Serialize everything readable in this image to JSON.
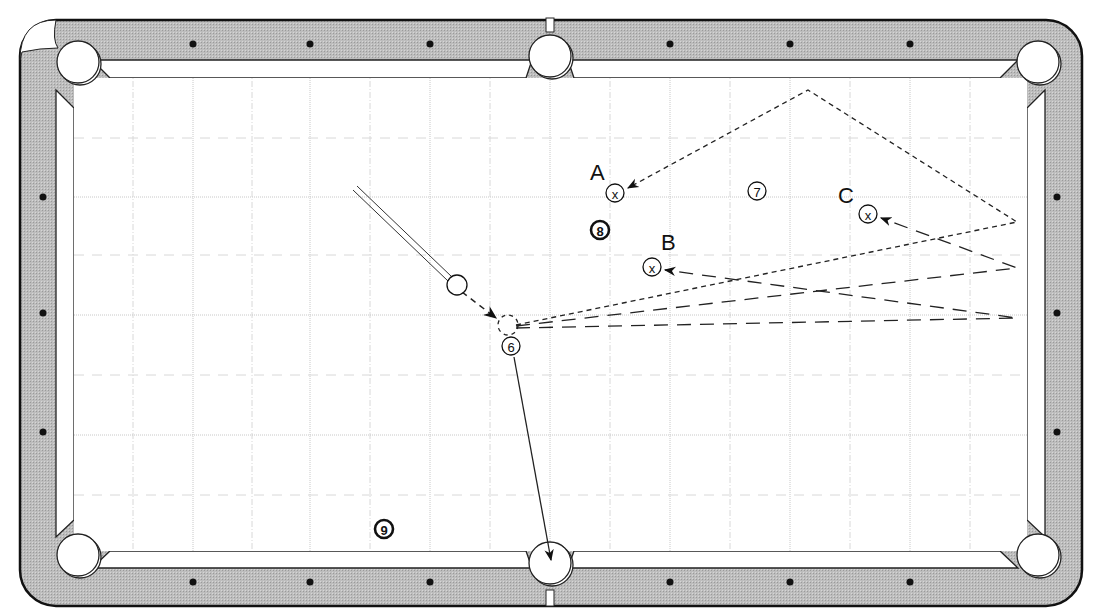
{
  "diagram": {
    "type": "pool-table-shot-diagram",
    "colors": {
      "rail": "#b8b8b8",
      "rail_outline": "#222222",
      "cloth": "#ffffff",
      "grid": "#c8c8c8",
      "ink": "#111111"
    },
    "balls": [
      {
        "id": "cue",
        "label": "",
        "x": 457,
        "y": 285
      },
      {
        "id": "6",
        "label": "6",
        "x": 511,
        "y": 346
      },
      {
        "id": "7",
        "label": "7",
        "x": 757,
        "y": 191
      },
      {
        "id": "8",
        "label": "8",
        "x": 600,
        "y": 230
      },
      {
        "id": "9",
        "label": "9",
        "x": 384,
        "y": 529
      }
    ],
    "targets": [
      {
        "id": "A",
        "label": "A",
        "x": 615,
        "y": 193,
        "label_x": 590,
        "label_y": 180
      },
      {
        "id": "B",
        "label": "B",
        "x": 652,
        "y": 267,
        "label_x": 661,
        "label_y": 250
      },
      {
        "id": "C",
        "label": "C",
        "x": 868,
        "y": 214,
        "label_x": 838,
        "label_y": 203
      }
    ],
    "target_mark": "x",
    "ghost_ball": {
      "x": 508,
      "y": 325
    },
    "cue_stick": {
      "from_x": 355,
      "from_y": 188,
      "to_x": 450,
      "to_y": 279
    },
    "paths": [
      {
        "name": "cue-to-ghost",
        "style": "dash-medium",
        "points": [
          [
            462,
            292
          ],
          [
            496,
            318
          ]
        ]
      },
      {
        "name": "object-to-pocket",
        "style": "solid",
        "points": [
          [
            514,
            357
          ],
          [
            551,
            560
          ]
        ]
      },
      {
        "name": "route-A",
        "style": "dash-short",
        "points": [
          [
            516,
            325
          ],
          [
            1017,
            222
          ],
          [
            808,
            90
          ],
          [
            628,
            188
          ]
        ]
      },
      {
        "name": "route-B",
        "style": "dash-long",
        "points": [
          [
            516,
            328
          ],
          [
            1017,
            318
          ],
          [
            665,
            270
          ]
        ]
      },
      {
        "name": "route-C",
        "style": "dash-long",
        "points": [
          [
            516,
            326
          ],
          [
            1017,
            268
          ],
          [
            881,
            218
          ]
        ]
      }
    ],
    "diamonds": {
      "top": [
        [
          193,
          44
        ],
        [
          310,
          44
        ],
        [
          430,
          44
        ],
        [
          670,
          44
        ],
        [
          790,
          44
        ],
        [
          910,
          44
        ]
      ],
      "bottom": [
        [
          193,
          582
        ],
        [
          310,
          582
        ],
        [
          430,
          582
        ],
        [
          670,
          582
        ],
        [
          790,
          582
        ],
        [
          910,
          582
        ]
      ],
      "left": [
        [
          43,
          197
        ],
        [
          43,
          313
        ],
        [
          43,
          432
        ]
      ],
      "right": [
        [
          1057,
          197
        ],
        [
          1057,
          313
        ],
        [
          1057,
          432
        ]
      ]
    },
    "pockets": [
      {
        "name": "top-left",
        "x": 78,
        "y": 62
      },
      {
        "name": "top-center",
        "x": 550,
        "y": 56
      },
      {
        "name": "top-right",
        "x": 1038,
        "y": 62
      },
      {
        "name": "bottom-left",
        "x": 78,
        "y": 555
      },
      {
        "name": "bottom-center",
        "x": 550,
        "y": 563
      },
      {
        "name": "bottom-right",
        "x": 1038,
        "y": 555
      }
    ],
    "grid": {
      "major_x": [
        193,
        310,
        430,
        550,
        670,
        790,
        910
      ],
      "minor_x": [
        133,
        252,
        370,
        490,
        610,
        730,
        850,
        970
      ],
      "major_y": [
        197,
        315,
        435
      ],
      "minor_y": [
        138,
        255,
        375,
        495
      ]
    }
  }
}
